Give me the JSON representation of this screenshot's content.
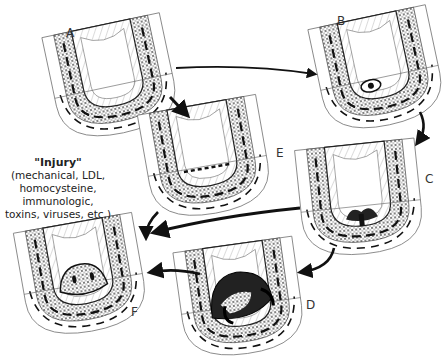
{
  "figure": {
    "panels": [
      {
        "id": "A",
        "label": "A"
      },
      {
        "id": "B",
        "label": "B"
      },
      {
        "id": "C",
        "label": "C"
      },
      {
        "id": "D",
        "label": "D"
      },
      {
        "id": "E",
        "label": "E"
      },
      {
        "id": "F",
        "label": "F"
      }
    ],
    "injury_note": {
      "title": "\"Injury\"",
      "lines": [
        "(mechanical, LDL,",
        "homocysteine,",
        "immunologic,",
        "toxins, viruses, etc.)"
      ]
    },
    "arrows": [
      {
        "from": "A",
        "to": "B"
      },
      {
        "from": "A",
        "to": "E"
      },
      {
        "from": "B",
        "to": "C"
      },
      {
        "from": "C",
        "to": "F"
      },
      {
        "from": "E",
        "to": "F"
      },
      {
        "from": "C",
        "to": "D"
      },
      {
        "from": "D",
        "to": "F"
      }
    ],
    "colors": {
      "ink": "#111111",
      "paper": "#ffffff",
      "stipple": "#555555"
    }
  }
}
